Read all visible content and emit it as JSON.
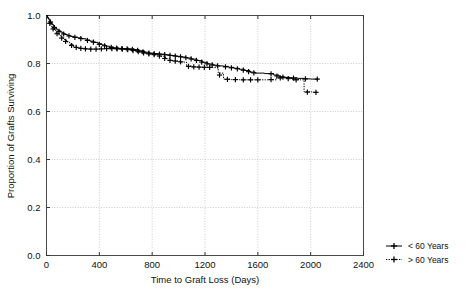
{
  "chart_data": {
    "type": "line",
    "subtype": "kaplan-meier-survival-step",
    "title": "",
    "xlabel": "Time to Graft Loss (Days)",
    "ylabel": "Proportion of Grafts Surviving",
    "xlim": [
      0,
      2400
    ],
    "ylim": [
      0.0,
      1.0
    ],
    "xticks": [
      0,
      400,
      800,
      1200,
      1600,
      2000,
      2400
    ],
    "xtick_labels": [
      "0",
      "400",
      "800",
      "1200",
      "1600",
      "2000",
      "2400"
    ],
    "yticks": [
      0.0,
      0.2,
      0.4,
      0.6,
      0.8,
      1.0
    ],
    "ytick_labels": [
      "0.0",
      "0.2",
      "0.4",
      "0.6",
      "0.8",
      "1.0"
    ],
    "grid": true,
    "grid_style": "dotted",
    "grid_color": "#bfbfbf",
    "legend_position": "right-bottom-outside",
    "line_color": "#000000",
    "series": [
      {
        "name": "< 60 Years",
        "dash": "solid",
        "marker": "plus",
        "points": [
          [
            0,
            1.0
          ],
          [
            8,
            0.992
          ],
          [
            16,
            0.985
          ],
          [
            24,
            0.978
          ],
          [
            32,
            0.971
          ],
          [
            42,
            0.963
          ],
          [
            52,
            0.956
          ],
          [
            62,
            0.949
          ],
          [
            74,
            0.943
          ],
          [
            88,
            0.937
          ],
          [
            104,
            0.931
          ],
          [
            120,
            0.926
          ],
          [
            138,
            0.921
          ],
          [
            158,
            0.917
          ],
          [
            180,
            0.913
          ],
          [
            205,
            0.91
          ],
          [
            235,
            0.907
          ],
          [
            268,
            0.903
          ],
          [
            300,
            0.898
          ],
          [
            330,
            0.893
          ],
          [
            360,
            0.888
          ],
          [
            390,
            0.882
          ],
          [
            420,
            0.877
          ],
          [
            450,
            0.872
          ],
          [
            480,
            0.868
          ],
          [
            510,
            0.865
          ],
          [
            545,
            0.863
          ],
          [
            580,
            0.862
          ],
          [
            620,
            0.861
          ],
          [
            660,
            0.858
          ],
          [
            700,
            0.853
          ],
          [
            740,
            0.847
          ],
          [
            780,
            0.843
          ],
          [
            820,
            0.841
          ],
          [
            860,
            0.839
          ],
          [
            900,
            0.836
          ],
          [
            940,
            0.833
          ],
          [
            980,
            0.83
          ],
          [
            1020,
            0.827
          ],
          [
            1060,
            0.823
          ],
          [
            1100,
            0.818
          ],
          [
            1140,
            0.812
          ],
          [
            1180,
            0.805
          ],
          [
            1220,
            0.798
          ],
          [
            1260,
            0.793
          ],
          [
            1300,
            0.79
          ],
          [
            1340,
            0.788
          ],
          [
            1380,
            0.784
          ],
          [
            1420,
            0.78
          ],
          [
            1460,
            0.776
          ],
          [
            1500,
            0.771
          ],
          [
            1540,
            0.764
          ],
          [
            1580,
            0.76
          ],
          [
            1650,
            0.758
          ],
          [
            1720,
            0.752
          ],
          [
            1760,
            0.745
          ],
          [
            1800,
            0.742
          ],
          [
            1850,
            0.74
          ],
          [
            1900,
            0.738
          ],
          [
            1950,
            0.736
          ],
          [
            2000,
            0.735
          ],
          [
            2060,
            0.735
          ]
        ],
        "censor_marks": [
          [
            30,
            0.973
          ],
          [
            60,
            0.95
          ],
          [
            95,
            0.934
          ],
          [
            130,
            0.923
          ],
          [
            170,
            0.915
          ],
          [
            215,
            0.909
          ],
          [
            260,
            0.904
          ],
          [
            310,
            0.896
          ],
          [
            355,
            0.889
          ],
          [
            400,
            0.88
          ],
          [
            440,
            0.874
          ],
          [
            490,
            0.867
          ],
          [
            530,
            0.864
          ],
          [
            570,
            0.862
          ],
          [
            610,
            0.861
          ],
          [
            650,
            0.859
          ],
          [
            690,
            0.855
          ],
          [
            730,
            0.849
          ],
          [
            775,
            0.843
          ],
          [
            815,
            0.841
          ],
          [
            855,
            0.839
          ],
          [
            895,
            0.837
          ],
          [
            935,
            0.834
          ],
          [
            975,
            0.831
          ],
          [
            1015,
            0.828
          ],
          [
            1055,
            0.824
          ],
          [
            1095,
            0.819
          ],
          [
            1135,
            0.813
          ],
          [
            1175,
            0.806
          ],
          [
            1215,
            0.799
          ],
          [
            1255,
            0.794
          ],
          [
            1295,
            0.79
          ],
          [
            1355,
            0.786
          ],
          [
            1400,
            0.782
          ],
          [
            1445,
            0.778
          ],
          [
            1490,
            0.772
          ],
          [
            1530,
            0.766
          ],
          [
            1570,
            0.761
          ],
          [
            1700,
            0.757
          ],
          [
            1745,
            0.748
          ],
          [
            1790,
            0.743
          ],
          [
            1870,
            0.739
          ],
          [
            1960,
            0.736
          ],
          [
            2050,
            0.735
          ]
        ]
      },
      {
        "name": "> 60 Years",
        "dash": "dotted",
        "marker": "plus",
        "points": [
          [
            0,
            1.0
          ],
          [
            8,
            0.988
          ],
          [
            18,
            0.976
          ],
          [
            28,
            0.964
          ],
          [
            40,
            0.952
          ],
          [
            55,
            0.941
          ],
          [
            70,
            0.93
          ],
          [
            88,
            0.92
          ],
          [
            108,
            0.91
          ],
          [
            128,
            0.9
          ],
          [
            150,
            0.89
          ],
          [
            175,
            0.88
          ],
          [
            200,
            0.872
          ],
          [
            230,
            0.866
          ],
          [
            265,
            0.863
          ],
          [
            300,
            0.861
          ],
          [
            340,
            0.86
          ],
          [
            380,
            0.86
          ],
          [
            420,
            0.861
          ],
          [
            460,
            0.862
          ],
          [
            500,
            0.862
          ],
          [
            540,
            0.861
          ],
          [
            580,
            0.86
          ],
          [
            620,
            0.858
          ],
          [
            660,
            0.853
          ],
          [
            700,
            0.848
          ],
          [
            740,
            0.843
          ],
          [
            780,
            0.84
          ],
          [
            820,
            0.836
          ],
          [
            860,
            0.83
          ],
          [
            900,
            0.82
          ],
          [
            940,
            0.812
          ],
          [
            980,
            0.81
          ],
          [
            1020,
            0.806
          ],
          [
            1060,
            0.79
          ],
          [
            1100,
            0.786
          ],
          [
            1140,
            0.785
          ],
          [
            1180,
            0.784
          ],
          [
            1220,
            0.784
          ],
          [
            1260,
            0.783
          ],
          [
            1300,
            0.76
          ],
          [
            1340,
            0.735
          ],
          [
            1400,
            0.733
          ],
          [
            1460,
            0.732
          ],
          [
            1520,
            0.732
          ],
          [
            1580,
            0.732
          ],
          [
            1660,
            0.732
          ],
          [
            1740,
            0.74
          ],
          [
            1800,
            0.74
          ],
          [
            1860,
            0.733
          ],
          [
            1920,
            0.732
          ],
          [
            1950,
            0.682
          ],
          [
            2010,
            0.68
          ],
          [
            2060,
            0.68
          ]
        ],
        "censor_marks": [
          [
            25,
            0.967
          ],
          [
            50,
            0.944
          ],
          [
            80,
            0.924
          ],
          [
            115,
            0.906
          ],
          [
            145,
            0.892
          ],
          [
            190,
            0.875
          ],
          [
            225,
            0.867
          ],
          [
            260,
            0.863
          ],
          [
            295,
            0.861
          ],
          [
            335,
            0.86
          ],
          [
            375,
            0.86
          ],
          [
            415,
            0.861
          ],
          [
            455,
            0.862
          ],
          [
            495,
            0.862
          ],
          [
            535,
            0.861
          ],
          [
            575,
            0.86
          ],
          [
            615,
            0.858
          ],
          [
            655,
            0.854
          ],
          [
            695,
            0.849
          ],
          [
            735,
            0.844
          ],
          [
            775,
            0.84
          ],
          [
            815,
            0.837
          ],
          [
            855,
            0.831
          ],
          [
            895,
            0.821
          ],
          [
            935,
            0.813
          ],
          [
            975,
            0.81
          ],
          [
            1015,
            0.807
          ],
          [
            1075,
            0.788
          ],
          [
            1115,
            0.786
          ],
          [
            1155,
            0.785
          ],
          [
            1195,
            0.784
          ],
          [
            1235,
            0.784
          ],
          [
            1310,
            0.752
          ],
          [
            1370,
            0.734
          ],
          [
            1430,
            0.733
          ],
          [
            1490,
            0.732
          ],
          [
            1545,
            0.732
          ],
          [
            1600,
            0.732
          ],
          [
            1700,
            0.733
          ],
          [
            1770,
            0.74
          ],
          [
            1830,
            0.737
          ],
          [
            1890,
            0.732
          ],
          [
            1975,
            0.681
          ],
          [
            2040,
            0.68
          ]
        ]
      }
    ]
  },
  "legend": {
    "entries": [
      {
        "label": "< 60 Years",
        "style": "solid",
        "marker": "plus-marker"
      },
      {
        "label": "> 60 Years",
        "style": "dotted",
        "marker": "plus-marker"
      }
    ]
  }
}
